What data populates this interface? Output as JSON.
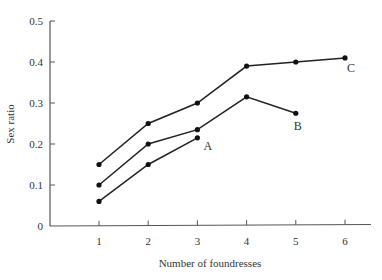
{
  "chart_data": {
    "type": "line",
    "title": "",
    "xlabel": "Number of foundresses",
    "ylabel": "Sex ratio",
    "xlim": [
      0,
      6.5
    ],
    "ylim": [
      0,
      0.5
    ],
    "x_ticks": [
      "1",
      "2",
      "3",
      "4",
      "5",
      "6"
    ],
    "y_ticks": [
      "0",
      "0.1",
      "0.2",
      "0.3",
      "0.4",
      "0.5"
    ],
    "grid": false,
    "legend": "none (lines labeled directly)",
    "series": [
      {
        "name": "C",
        "x": [
          1,
          2,
          3,
          4,
          5,
          6
        ],
        "values": [
          0.15,
          0.25,
          0.3,
          0.39,
          0.4,
          0.41
        ]
      },
      {
        "name": "B",
        "x": [
          1,
          2,
          3,
          4,
          5
        ],
        "values": [
          0.1,
          0.2,
          0.235,
          0.315,
          0.275
        ]
      },
      {
        "name": "A",
        "x": [
          1,
          2,
          3
        ],
        "values": [
          0.06,
          0.15,
          0.215
        ]
      }
    ]
  }
}
